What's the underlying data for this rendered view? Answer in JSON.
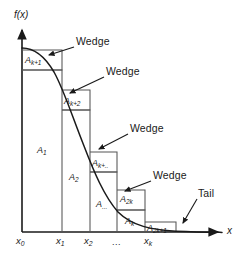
{
  "figure": {
    "axes": {
      "y_label": "f(x)",
      "x_label": "x",
      "origin_x": 22,
      "baseline_y": 232,
      "x_axis_end": 222,
      "y_axis_top": 26
    },
    "colors": {
      "curve": "#1a1a1a",
      "rect": "#555555",
      "axis": "#1a1a1a",
      "text": "#1a1a1a",
      "background": "#ffffff"
    },
    "x_ticks": [
      {
        "label": "x",
        "sub": "0",
        "x": 22
      },
      {
        "label": "x",
        "sub": "1",
        "x": 62
      },
      {
        "label": "x",
        "sub": "2",
        "x": 90
      },
      {
        "label": "...",
        "sub": "",
        "x": 117
      },
      {
        "label": "x",
        "sub": "k",
        "x": 150
      }
    ],
    "areas": [
      {
        "name": "A",
        "sub": "k+1",
        "x": 25,
        "y": 61
      },
      {
        "name": "A",
        "sub": "k+2",
        "x": 64,
        "y": 102
      },
      {
        "name": "A",
        "sub": "1",
        "x": 38,
        "y": 150
      },
      {
        "name": "A",
        "sub": "k+..",
        "x": 92,
        "y": 165
      },
      {
        "name": "A",
        "sub": "2",
        "x": 68,
        "y": 177
      },
      {
        "name": "A",
        "sub": "...",
        "x": 96,
        "y": 204
      },
      {
        "name": "A",
        "sub": "2k",
        "x": 120,
        "y": 198
      },
      {
        "name": "A",
        "sub": "k",
        "x": 124,
        "y": 221
      },
      {
        "name": "A",
        "sub": "2k+1",
        "x": 148,
        "y": 226
      }
    ],
    "annotations": [
      {
        "text": "Wedge",
        "label_x": 76,
        "label_y": 41,
        "line_x1": 74,
        "line_y1": 48,
        "line_x2": 48,
        "line_y2": 56,
        "tip_x": 45,
        "tip_y": 57
      },
      {
        "text": "Wedge",
        "label_x": 106,
        "label_y": 71,
        "line_x1": 104,
        "line_y1": 78,
        "line_x2": 70,
        "line_y2": 93,
        "tip_x": 66,
        "tip_y": 95
      },
      {
        "text": "Wedge",
        "label_x": 130,
        "label_y": 128,
        "line_x1": 128,
        "line_y1": 135,
        "line_x2": 98,
        "line_y2": 149,
        "tip_x": 95,
        "tip_y": 151
      },
      {
        "text": "Wedge",
        "label_x": 153,
        "label_y": 175,
        "line_x1": 151,
        "line_y1": 182,
        "line_x2": 124,
        "line_y2": 192,
        "tip_x": 121,
        "tip_y": 194
      },
      {
        "text": "Tail",
        "label_x": 197,
        "label_y": 193,
        "line_x1": 196,
        "line_y1": 200,
        "line_x2": 182,
        "line_y2": 224,
        "tip_x": 180,
        "tip_y": 227
      }
    ],
    "steps": [
      {
        "label": "A_k+1 wedge row",
        "x_left": 22,
        "x_right": 62,
        "y_top": 50
      },
      {
        "label": "A_1 row",
        "x_left": 22,
        "x_right": 62,
        "y_top": 70
      },
      {
        "label": "A_k+2 wedge row",
        "x_left": 62,
        "x_right": 90,
        "y_top": 90
      },
      {
        "label": "A_2 row",
        "x_left": 62,
        "x_right": 90,
        "y_top": 110
      },
      {
        "label": "A_k+.. wedge row",
        "x_left": 90,
        "x_right": 117,
        "y_top": 152
      },
      {
        "label": "A_... row",
        "x_left": 90,
        "x_right": 117,
        "y_top": 172
      },
      {
        "label": "A_2k wedge row",
        "x_left": 117,
        "x_right": 145,
        "y_top": 190
      },
      {
        "label": "A_k row",
        "x_left": 117,
        "x_right": 145,
        "y_top": 210
      },
      {
        "label": "A_2k+1 row",
        "x_left": 145,
        "x_right": 175,
        "y_top": 222
      }
    ],
    "curve": {
      "description": "monotone decreasing sigmoid-like density curve from top-left to flat tail at right",
      "path": "M 22,48 C 34,48 44,55 54,72 C 64,90 72,116 84,146 C 94,172 104,196 118,212 C 132,226 152,230 176,231.2 C 196,232 210,232.2 222,232.4"
    }
  }
}
